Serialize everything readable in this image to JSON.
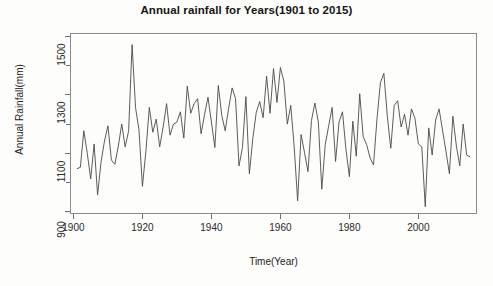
{
  "chart_data": {
    "type": "line",
    "title": "Annual rainfall for Years(1901 to 2015)",
    "xlabel": "Time(Year)",
    "ylabel": "Annual Rainfall(mm)",
    "xlim": [
      1899,
      2017
    ],
    "ylim": [
      890,
      1510
    ],
    "xticks": [
      1900,
      1920,
      1940,
      1960,
      1980,
      2000
    ],
    "yticks": [
      900,
      1100,
      1300,
      1500
    ],
    "minor_yticks": [
      1000,
      1200,
      1400
    ],
    "grid": false,
    "legend": null,
    "line_color": "#4a4a4a",
    "line_width": 0.9,
    "series": [
      {
        "name": "Annual Rainfall(mm)",
        "x": [
          1901,
          1902,
          1903,
          1904,
          1905,
          1906,
          1907,
          1908,
          1909,
          1910,
          1911,
          1912,
          1913,
          1914,
          1915,
          1916,
          1917,
          1918,
          1919,
          1920,
          1921,
          1922,
          1923,
          1924,
          1925,
          1926,
          1927,
          1928,
          1929,
          1930,
          1931,
          1932,
          1933,
          1934,
          1935,
          1936,
          1937,
          1938,
          1939,
          1940,
          1941,
          1942,
          1943,
          1944,
          1945,
          1946,
          1947,
          1948,
          1949,
          1950,
          1951,
          1952,
          1953,
          1954,
          1955,
          1956,
          1957,
          1958,
          1959,
          1960,
          1961,
          1962,
          1963,
          1964,
          1965,
          1966,
          1967,
          1968,
          1969,
          1970,
          1971,
          1972,
          1973,
          1974,
          1975,
          1976,
          1977,
          1978,
          1979,
          1980,
          1981,
          1982,
          1983,
          1984,
          1985,
          1986,
          1987,
          1988,
          1989,
          1990,
          1991,
          1992,
          1993,
          1994,
          1995,
          1996,
          1997,
          1998,
          1999,
          2000,
          2001,
          2002,
          2003,
          2004,
          2005,
          2006,
          2007,
          2008,
          2009,
          2010,
          2011,
          2012,
          2013,
          2014,
          2015
        ],
        "values": [
          1045,
          1050,
          1175,
          1098,
          1010,
          1130,
          955,
          1068,
          1140,
          1192,
          1075,
          1060,
          1122,
          1198,
          1120,
          1175,
          1470,
          1255,
          1178,
          985,
          1105,
          1255,
          1170,
          1215,
          1120,
          1188,
          1268,
          1160,
          1198,
          1205,
          1240,
          1150,
          1328,
          1235,
          1268,
          1285,
          1165,
          1230,
          1290,
          1205,
          1118,
          1330,
          1228,
          1175,
          1252,
          1322,
          1285,
          1055,
          1118,
          1292,
          1028,
          1148,
          1238,
          1275,
          1220,
          1362,
          1235,
          1388,
          1272,
          1392,
          1345,
          1198,
          1262,
          1120,
          935,
          1162,
          1100,
          1035,
          1210,
          1270,
          1205,
          975,
          1128,
          1192,
          1255,
          1070,
          1205,
          1240,
          1112,
          1018,
          1208,
          1088,
          1302,
          1155,
          1128,
          1082,
          1058,
          1215,
          1340,
          1372,
          1225,
          1115,
          1262,
          1278,
          1188,
          1232,
          1160,
          1250,
          1218,
          1130,
          1120,
          915,
          1185,
          1092,
          1212,
          1250,
          1178,
          1105,
          1028,
          1225,
          1125,
          1055,
          1198,
          1092,
          1085
        ]
      }
    ]
  },
  "axes": {
    "ytick_labels": [
      "900",
      "1100",
      "1300",
      "1500"
    ],
    "xtick_labels": [
      "1900",
      "1920",
      "1940",
      "1960",
      "1980",
      "2000"
    ]
  }
}
